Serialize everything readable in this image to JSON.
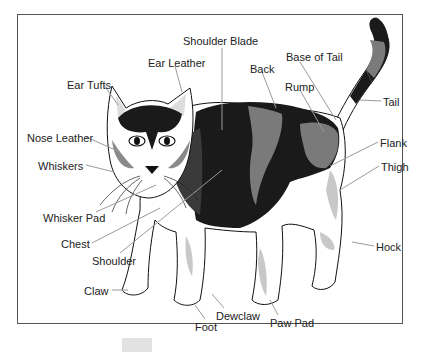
{
  "diagram": {
    "colors": {
      "frame": "#555555",
      "outline": "#111111",
      "dark_patch": "#1a1a1a",
      "gray_patch": "#7a7a7a",
      "light_shade": "#c8c8c8",
      "pointer": "#9a9a9a",
      "text": "#222222"
    },
    "labels": [
      {
        "id": "shoulder-blade",
        "text": "Shoulder Blade",
        "x": 183,
        "y": 36
      },
      {
        "id": "ear-leather",
        "text": "Ear Leather",
        "x": 148,
        "y": 58
      },
      {
        "id": "base-of-tail",
        "text": "Base of Tail",
        "x": 286,
        "y": 52
      },
      {
        "id": "back",
        "text": "Back",
        "x": 250,
        "y": 64
      },
      {
        "id": "ear-tufts",
        "text": "Ear Tufts",
        "x": 67,
        "y": 80
      },
      {
        "id": "rump",
        "text": "Rump",
        "x": 285,
        "y": 82
      },
      {
        "id": "tail",
        "text": "Tail",
        "x": 383,
        "y": 97
      },
      {
        "id": "nose-leather",
        "text": "Nose Leather",
        "x": 27,
        "y": 133
      },
      {
        "id": "flank",
        "text": "Flank",
        "x": 380,
        "y": 138
      },
      {
        "id": "whiskers",
        "text": "Whiskers",
        "x": 38,
        "y": 161
      },
      {
        "id": "thigh",
        "text": "Thigh",
        "x": 381,
        "y": 162
      },
      {
        "id": "whisker-pad",
        "text": "Whisker Pad",
        "x": 43,
        "y": 213
      },
      {
        "id": "chest",
        "text": "Chest",
        "x": 61,
        "y": 239
      },
      {
        "id": "hock",
        "text": "Hock",
        "x": 376,
        "y": 242
      },
      {
        "id": "shoulder",
        "text": "Shoulder",
        "x": 92,
        "y": 256
      },
      {
        "id": "claw",
        "text": "Claw",
        "x": 84,
        "y": 286
      },
      {
        "id": "dewclaw",
        "text": "Dewclaw",
        "x": 216,
        "y": 311
      },
      {
        "id": "paw-pad",
        "text": "Paw Pad",
        "x": 270,
        "y": 318
      },
      {
        "id": "foot",
        "text": "Foot",
        "x": 195,
        "y": 322
      }
    ]
  }
}
